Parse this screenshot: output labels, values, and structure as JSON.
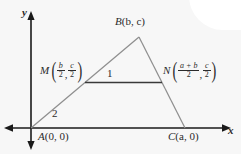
{
  "figure": {
    "type": "coordinate-geometry-diagram",
    "axes": {
      "x_label": "x",
      "y_label": "y",
      "origin_label": "A(0, 0)"
    },
    "colors": {
      "background": "#f7f7f7",
      "triangle_stroke": "#8f8f8f",
      "midsegment_stroke": "#3a3a3a",
      "axis_stroke": "#1a1a1a",
      "text": "#2b2b2b"
    },
    "vertices": [
      {
        "name": "A",
        "label": "A(0, 0)",
        "letter": "A",
        "coords": "(0, 0)"
      },
      {
        "name": "B",
        "label": "B(b, c)",
        "letter": "B",
        "coords": "(b, c)"
      },
      {
        "name": "C",
        "label": "C(a, 0)",
        "letter": "C",
        "coords": "(a, 0)"
      }
    ],
    "midpoints": [
      {
        "name": "M",
        "letter": "M",
        "x_numerator": "b",
        "x_denominator": "2",
        "y_numerator": "c",
        "y_denominator": "2",
        "separator": ","
      },
      {
        "name": "N",
        "letter": "N",
        "x_numerator": "a + b",
        "x_denominator": "2",
        "y_numerator": "c",
        "y_denominator": "2",
        "separator": ","
      }
    ],
    "marks": [
      {
        "name": "angle-1",
        "label": "1"
      },
      {
        "name": "angle-2",
        "label": "2"
      }
    ]
  }
}
